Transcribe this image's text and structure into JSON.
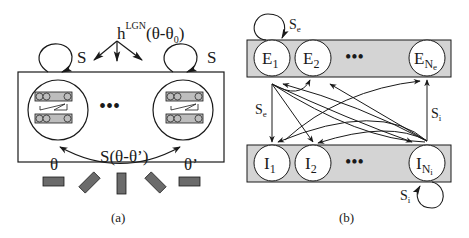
{
  "panel_a": {
    "caption": "(a)",
    "input_label_base": "h",
    "input_label_super": "LGN",
    "input_label_arg": "(θ-θ",
    "input_label_arg_sub": "0",
    "input_label_close": ")",
    "self_coupling_left": "S",
    "self_coupling_right": "S",
    "lateral_coupling": "S(θ-θ’)",
    "theta_left": "θ",
    "theta_right": "θ’",
    "ellipsis": "•••",
    "colors": {
      "bar_fill": "#6b6b6b",
      "circle_stroke": "#1a1a1a",
      "hypercol_fill": "#bdbdbd"
    }
  },
  "panel_b": {
    "caption": "(b)",
    "excitatory_row": {
      "nodes": [
        {
          "base": "E",
          "sub": "1"
        },
        {
          "base": "E",
          "sub": "2"
        },
        {
          "base": "E",
          "sub": "N",
          "subsub": "e"
        }
      ],
      "ellipsis": "•••"
    },
    "inhibitory_row": {
      "nodes": [
        {
          "base": "I",
          "sub": "1"
        },
        {
          "base": "I",
          "sub": "2"
        },
        {
          "base": "I",
          "sub": "N",
          "subsub": "i"
        }
      ],
      "ellipsis": "•••"
    },
    "labels": {
      "self_e": "S",
      "self_e_sub": "e",
      "e_to_i": "S",
      "e_to_i_sub": "e",
      "i_to_e": "S",
      "i_to_e_sub": "i",
      "self_i": "S",
      "self_i_sub": "i"
    },
    "colors": {
      "row_fill": "#d4d4d4",
      "node_fill": "#ffffff",
      "stroke": "#1a1a1a"
    }
  }
}
